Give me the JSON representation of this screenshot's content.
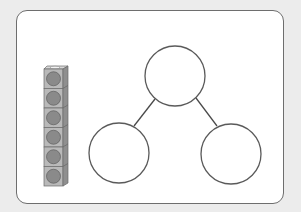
{
  "colors": {
    "background": "#ececec",
    "frame_fill": "#ffffff",
    "frame_stroke": "#6e6e6e",
    "circle_stroke": "#5a5a5a",
    "connector_stroke": "#4a4a4a",
    "cube_face": "#b9b9b9",
    "cube_side": "#8f8f8f",
    "cube_top": "#d8d8d8",
    "cube_dot": "#8a8a8a"
  },
  "cube_stack": {
    "count": 6,
    "label": "Cube tower of 6"
  },
  "part_whole": {
    "whole": {
      "label": "",
      "value": ""
    },
    "parts": [
      {
        "label": "",
        "value": ""
      },
      {
        "label": "",
        "value": ""
      }
    ]
  }
}
